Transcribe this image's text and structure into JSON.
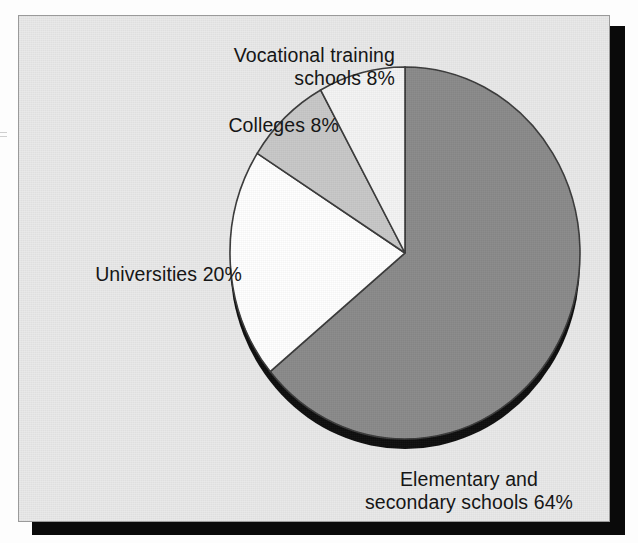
{
  "document": {
    "background_color": "#fdfdfd",
    "panel_background_color": "#e9e9e9",
    "panel_border_color": "#9a9a9a",
    "panel_shadow_color": "#0a0a0a"
  },
  "chart_data": {
    "type": "pie",
    "title": "",
    "subtitle": "",
    "xlabel": "",
    "ylabel": "",
    "legend_position": "none",
    "grid": false,
    "labels_placement": "outside-callout",
    "start_angle_deg": 0,
    "direction": "clockwise",
    "unit": "%",
    "total": 100,
    "categories": [
      "Elementary and secondary schools",
      "Universities",
      "Colleges",
      "Vocational training schools"
    ],
    "values": [
      64,
      20,
      8,
      8
    ],
    "slices": [
      {
        "name": "Elementary and secondary schools",
        "label": "Elementary and\nsecondary schools 64%",
        "value": 64,
        "percent_text": "64%",
        "color": "#8a8a8a",
        "start_deg": 0,
        "end_deg": 230.4
      },
      {
        "name": "Universities",
        "label": "Universities 20%",
        "value": 20,
        "percent_text": "20%",
        "color": "#ffffff",
        "start_deg": 230.4,
        "end_deg": 302.4
      },
      {
        "name": "Colleges",
        "label": "Colleges 8%",
        "value": 8,
        "percent_text": "8%",
        "color": "#c8c8c8",
        "start_deg": 302.4,
        "end_deg": 331.2
      },
      {
        "name": "Vocational training schools",
        "label": "Vocational training\nschools 8%",
        "value": 8,
        "percent_text": "8%",
        "color": "#f4f4f4",
        "start_deg": 331.2,
        "end_deg": 360
      }
    ],
    "depth_shadow_color": "#0d0d0d",
    "outline_color": "#3a3a3a"
  },
  "labels": {
    "vocational": "Vocational training\nschools 8%",
    "colleges": "Colleges 8%",
    "universities": "Universities 20%",
    "elementary": "Elementary and\nsecondary schools 64%"
  }
}
